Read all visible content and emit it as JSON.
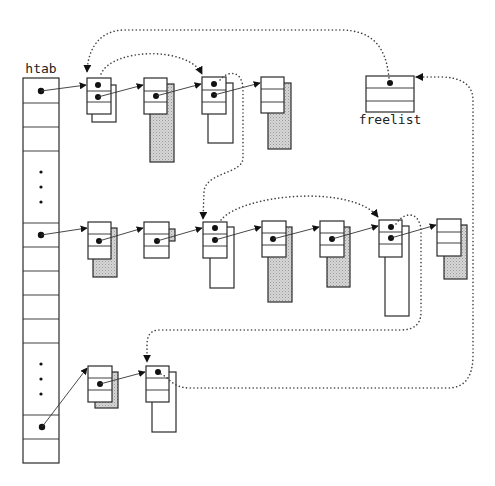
{
  "labels": {
    "hash_table": "htab",
    "free_list": "freelist"
  },
  "colors": {
    "stroke": "#2a2a2a",
    "hatch_fill": "#c8c8c8",
    "background": "#ffffff"
  },
  "structure": {
    "htab": {
      "visible_slots": 12,
      "occupied_slots_with_pointers": 3,
      "ellipsis_groups": 2
    },
    "chains": [
      {
        "row": 1,
        "node_count": 4,
        "back_blocks": [
          "white",
          "shaded",
          "white",
          "shaded"
        ]
      },
      {
        "row": 2,
        "node_count": 7,
        "back_blocks": [
          "shaded",
          "shaded",
          "white",
          "shaded",
          "shaded",
          "white",
          "shaded"
        ]
      },
      {
        "row": 3,
        "node_count": 2,
        "back_blocks": [
          "shaded",
          "white"
        ]
      }
    ],
    "free_list_links": [
      "freelist -> row1 node1",
      "row1 node1 -> row1 node3",
      "row1 node3 -> row2 node3",
      "row2 node3 -> row2 node6",
      "row2 node6 -> row3 node2",
      "row3 node2 -> freelist"
    ]
  }
}
